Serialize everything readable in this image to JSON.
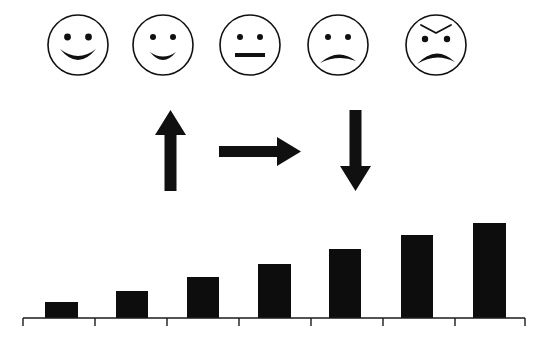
{
  "colors": {
    "ink": "#101010",
    "background": "#ffffff",
    "bar_fill": "#0d0d0d",
    "axis": "#1a1a1a"
  },
  "faces": {
    "count": 5,
    "radius": 30,
    "center_y": 45,
    "stroke_width": 1.6,
    "items": [
      {
        "name": "very-happy-face",
        "label": "Very happy",
        "cx": 78,
        "mouth": "big-smile",
        "eyebrows": "none",
        "eye_radius": 3.4
      },
      {
        "name": "happy-face",
        "label": "Happy",
        "cx": 163,
        "mouth": "smile",
        "eyebrows": "none",
        "eye_radius": 3.0
      },
      {
        "name": "neutral-face",
        "label": "Neutral",
        "cx": 250,
        "mouth": "flat",
        "eyebrows": "none",
        "eye_radius": 3.0
      },
      {
        "name": "sad-face",
        "label": "Sad",
        "cx": 338,
        "mouth": "frown",
        "eyebrows": "none",
        "eye_radius": 3.0
      },
      {
        "name": "angry-face",
        "label": "Angry",
        "cx": 436,
        "mouth": "deep-frown",
        "eyebrows": "angled-down",
        "eye_radius": 3.2
      }
    ]
  },
  "arrows": {
    "count": 3,
    "items": [
      {
        "name": "up-arrow",
        "direction": "up",
        "label": "Up",
        "x": 155,
        "y": 110,
        "width": 31,
        "height": 81
      },
      {
        "name": "right-arrow",
        "direction": "right",
        "label": "Right",
        "x": 219,
        "y": 137,
        "width": 82,
        "height": 29
      },
      {
        "name": "down-arrow",
        "direction": "down",
        "label": "Down",
        "x": 340,
        "y": 110,
        "width": 31,
        "height": 81
      }
    ]
  },
  "chart_data": {
    "type": "bar",
    "title": "",
    "xlabel": "",
    "ylabel": "",
    "categories": [
      "1",
      "2",
      "3",
      "4",
      "5",
      "6",
      "7"
    ],
    "values": [
      15,
      26,
      40,
      53,
      68,
      82,
      94
    ],
    "ylim": [
      0,
      100
    ],
    "grid": false,
    "legend": null,
    "axis": {
      "baseline_y": 318,
      "x_start": 23,
      "x_end": 525,
      "tick_count": 8,
      "tick_length": 8,
      "tick_positions": [
        23,
        95,
        167,
        239,
        311,
        383,
        455,
        525
      ]
    },
    "bars": [
      {
        "name": "bar-1",
        "x": 45,
        "width": 33,
        "top": 302,
        "height": 16
      },
      {
        "name": "bar-2",
        "x": 116,
        "width": 32,
        "top": 291,
        "height": 27
      },
      {
        "name": "bar-3",
        "x": 187,
        "width": 32,
        "top": 277,
        "height": 41
      },
      {
        "name": "bar-4",
        "x": 258,
        "width": 33,
        "top": 264,
        "height": 54
      },
      {
        "name": "bar-5",
        "x": 329,
        "width": 32,
        "top": 249,
        "height": 69
      },
      {
        "name": "bar-6",
        "x": 401,
        "width": 32,
        "top": 235,
        "height": 83
      },
      {
        "name": "bar-7",
        "x": 473,
        "width": 33,
        "top": 223,
        "height": 95
      }
    ]
  }
}
